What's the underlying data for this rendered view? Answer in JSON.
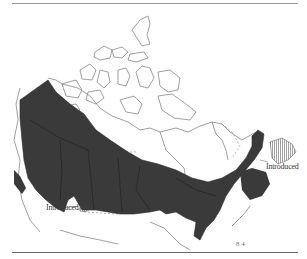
{
  "figure": {
    "type": "species range map",
    "region": "Canada",
    "colors": {
      "native_range_fill": "#3a3a3a",
      "coastline": "#6a6a6a",
      "introduced_hatch": "#555555",
      "background": "#ffffff"
    },
    "legend": {
      "native_range": "solid dark fill",
      "introduced_range": "hatched fill"
    },
    "labels": {
      "west_introduced": "Introduced",
      "east_introduced": "Introduced",
      "corner_mark": "8 4"
    }
  }
}
